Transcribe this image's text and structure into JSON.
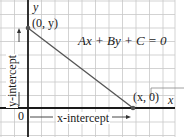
{
  "figure": {
    "equation": "Ax + By + C = 0",
    "axes": {
      "x_label": "x",
      "y_label": "y",
      "origin_label": "0"
    },
    "points": {
      "y_intercept_point": "(0, y)",
      "x_intercept_point": "(x, 0)"
    },
    "annotations": {
      "x_intercept": "x-intercept",
      "y_intercept": "y-intercept"
    },
    "colors": {
      "grid": "#c8c8c8",
      "axis": "#1a1a1a",
      "line": "#555555",
      "text": "#1a1a1a"
    },
    "grid_spacing_px": 13.5
  }
}
